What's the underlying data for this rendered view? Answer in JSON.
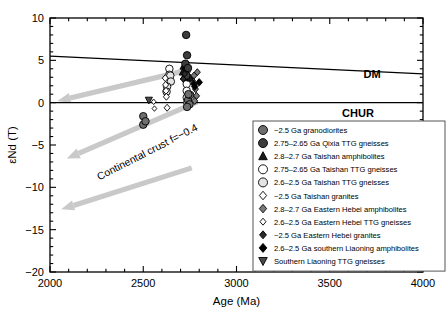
{
  "chart_data": {
    "type": "scatter",
    "title": "",
    "xlabel": "Age (Ma)",
    "ylabel": "εNd (T)",
    "xlim": [
      2000,
      4000
    ],
    "ylim": [
      -20,
      10
    ],
    "xticks": [
      2000,
      2500,
      3000,
      3500,
      4000
    ],
    "xtick_labels": [
      "2000",
      "2500",
      "3000",
      "3500",
      "4000"
    ],
    "yticks": [
      10,
      5,
      0,
      -5,
      -10,
      -15,
      -20
    ],
    "ytick_labels": [
      "10",
      "5",
      "0",
      "−5",
      "−10",
      "−15",
      "−20"
    ],
    "grid": false,
    "legend_position": "lower-right",
    "reference_lines": [
      {
        "name": "DM",
        "label": "DM",
        "points": [
          [
            2000,
            5.5
          ],
          [
            4000,
            3.4
          ]
        ],
        "color": "#000000"
      },
      {
        "name": "CHUR",
        "label": "CHUR",
        "points": [
          [
            2000,
            0
          ],
          [
            4000,
            0
          ]
        ],
        "color": "#000000"
      }
    ],
    "annotations": [
      {
        "name": "continental-crust",
        "text": "Continental crust f=−0.4",
        "x": 2530,
        "y": -6.2,
        "rotation": -27
      }
    ],
    "evolution_arrows": [
      {
        "from": [
          2750,
          3.9
        ],
        "to": [
          2040,
          0.2
        ]
      },
      {
        "from": [
          2790,
          0.1
        ],
        "to": [
          2090,
          -6.6
        ]
      },
      {
        "from": [
          2760,
          -7.7
        ],
        "to": [
          2060,
          -12.6
        ]
      }
    ],
    "series": [
      {
        "name": "~2.5 Ga granodiorites",
        "label": "~2.5 Ga granodiorites",
        "marker": "circle",
        "fill": "#6e6e6e",
        "edge": "#000000",
        "size": 7.5,
        "points": [
          [
            2500,
            -1.6
          ],
          [
            2500,
            -2.6
          ],
          [
            2512,
            -2.2
          ],
          [
            2740,
            0.3
          ],
          [
            2748,
            -0.2
          ],
          [
            2735,
            -0.5
          ],
          [
            2752,
            0.9
          ],
          [
            2742,
            1.0
          ]
        ]
      },
      {
        "name": "2.75–2.65 Ga Qixia TTG gneisses",
        "label": "2.75–2.65 Ga Qixia TTG gneisses",
        "marker": "circle",
        "fill": "#3c3c3c",
        "edge": "#000000",
        "size": 7.5,
        "points": [
          [
            2730,
            8.0
          ],
          [
            2735,
            5.6
          ],
          [
            2726,
            4.6
          ],
          [
            2740,
            4.1
          ],
          [
            2731,
            3.2
          ]
        ]
      },
      {
        "name": "2.8–2.7 Ga Taishan amphibolites",
        "label": "2.8–2.7 Ga Taishan amphibolites",
        "marker": "triangle-up",
        "fill": "#1a1a1a",
        "edge": "#000000",
        "size": 7.5,
        "points": [
          [
            2716,
            4.3
          ],
          [
            2722,
            3.9
          ],
          [
            2712,
            3.6
          ],
          [
            2726,
            4.6
          ],
          [
            2719,
            3.1
          ],
          [
            2745,
            3.0
          ],
          [
            2752,
            2.9
          ]
        ]
      },
      {
        "name": "2.75–2.65 Ga Taishan TTG gneisses",
        "label": " 2.75–2.65 Ga Taishan TTG gneisses",
        "marker": "circle",
        "fill": "#ffffff",
        "edge": "#000000",
        "size": 7.5,
        "points": [
          [
            2640,
            4.0
          ],
          [
            2640,
            3.3
          ],
          [
            2733,
            3.8
          ],
          [
            2733,
            3.0
          ],
          [
            2733,
            2.2
          ],
          [
            2733,
            1.4
          ]
        ]
      },
      {
        "name": "2.6–2.5 Ga Taishan TTG gneisses",
        "label": "2.6–2.5 Ga Taishan TTG gneisses",
        "marker": "circle",
        "fill": "#e4e4e4",
        "edge": "#000000",
        "size": 7.5,
        "points": [
          [
            2645,
            3.2
          ],
          [
            2648,
            2.5
          ],
          [
            2628,
            1.9
          ],
          [
            2625,
            1.3
          ],
          [
            2733,
            0.6
          ],
          [
            2736,
            0.0
          ]
        ]
      },
      {
        "name": "~2.5 Ga Taishan granites",
        "label": "~2.5 Ga Taishan granites",
        "marker": "diamond",
        "fill": "#ffffff",
        "edge": "#000000",
        "size": 7,
        "points": [
          [
            2618,
            2.9
          ],
          [
            2620,
            2.1
          ],
          [
            2622,
            1.4
          ],
          [
            2624,
            0.7
          ],
          [
            2628,
            -0.6
          ]
        ]
      },
      {
        "name": "2.8–2.7 Ga Eastern Hebei amphibolites",
        "label": "2.8–2.7 Ga Eastern Hebei amphibolites",
        "marker": "diamond",
        "fill": "#7a7a7a",
        "edge": "#000000",
        "size": 7,
        "points": [
          [
            2790,
            3.6
          ],
          [
            2772,
            3.2
          ],
          [
            2764,
            2.6
          ],
          [
            2780,
            1.6
          ],
          [
            2786,
            0.8
          ],
          [
            2776,
            0.2
          ]
        ]
      },
      {
        "name": "2.6–2.5 Ga Eastern Hebei TTG gneisses",
        "label": "2.6–2.5  Ga Eastern Hebei TTG gneisses",
        "marker": "diamond",
        "fill": "#ffffff",
        "edge": "#000000",
        "size": 5.5,
        "points": [
          [
            2556,
            0.1
          ],
          [
            2560,
            -0.7
          ]
        ]
      },
      {
        "name": "~2.5 Ga Eastern Hebei granites",
        "label": "~2.5 Ga Eastern Hebei granites",
        "marker": "diamond",
        "fill": "#2b2b2b",
        "edge": "#000000",
        "size": 6.5,
        "points": [
          [
            2722,
            3.4
          ],
          [
            2714,
            2.8
          ]
        ]
      },
      {
        "name": "2.6–2.5 Ga southern Liaoning amphibolites",
        "label": "2.6–2.5 Ga southern Liaoning amphibolites",
        "marker": "diamond",
        "fill": "#000000",
        "edge": "#000000",
        "size": 7.5,
        "points": [
          [
            2800,
            2.4
          ],
          [
            2776,
            1.9
          ],
          [
            2772,
            2.2
          ]
        ]
      },
      {
        "name": "Southern Liaoning TTG gneisses",
        "label": "Southern Liaoning TTG gneisses",
        "marker": "triangle-down",
        "fill": "#4a4a4a",
        "edge": "#000000",
        "size": 7.5,
        "points": [
          [
            2530,
            0.3
          ]
        ]
      }
    ]
  },
  "legend": {
    "items": [
      {
        "label": "~2.5 Ga granodiorites"
      },
      {
        "label": "2.75–2.65 Ga Qixia TTG gneisses"
      },
      {
        "label": "2.8–2.7 Ga Taishan amphibolites"
      },
      {
        "label": " 2.75–2.65 Ga Taishan TTG gneisses"
      },
      {
        "label": "2.6–2.5 Ga Taishan TTG gneisses"
      },
      {
        "label": "~2.5 Ga Taishan granites"
      },
      {
        "label": "2.8–2.7 Ga Eastern Hebei amphibolites"
      },
      {
        "label": "2.6–2.5  Ga Eastern Hebei TTG gneisses"
      },
      {
        "label": "~2.5 Ga Eastern Hebei granites"
      },
      {
        "label": "2.6–2.5 Ga southern Liaoning amphibolites"
      },
      {
        "label": "Southern Liaoning TTG gneisses"
      }
    ]
  },
  "colors": {
    "axis": "#000000",
    "arrow_band": "#c9c9c9",
    "legend_border": "#555555",
    "background": "#ffffff"
  }
}
